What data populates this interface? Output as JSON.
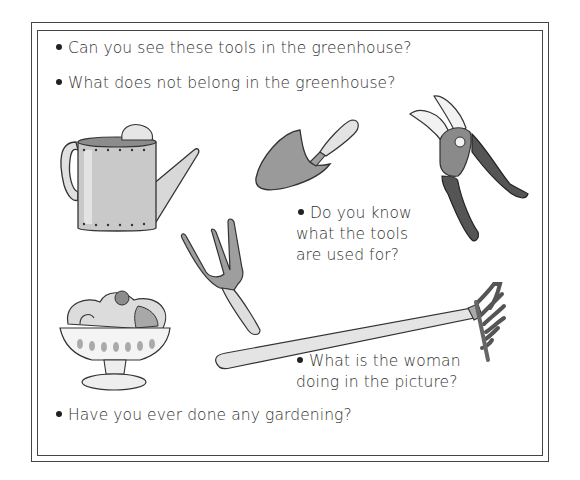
{
  "page": {
    "type": "worksheet",
    "frame": {
      "style": "double-line hand-drawn border",
      "color": "#444444"
    }
  },
  "questions": [
    {
      "text": "Can you see these tools in the greenhouse?"
    },
    {
      "text": "What does not belong in the greenhouse?"
    },
    {
      "line1": "Do you know",
      "line2": "what the tools",
      "line3": "are used for?"
    },
    {
      "line1": "What is the woman",
      "line2": "doing in the picture?"
    },
    {
      "text": "Have you ever done any gardening?"
    }
  ],
  "illustrations": [
    {
      "name": "watering-can",
      "label": "Watering can"
    },
    {
      "name": "trowel",
      "label": "Trowel"
    },
    {
      "name": "pruning-shears",
      "label": "Pruning shears"
    },
    {
      "name": "hand-fork",
      "label": "Hand fork"
    },
    {
      "name": "ice-cream-sundae",
      "label": "Ice cream sundae"
    },
    {
      "name": "rake",
      "label": "Rake"
    }
  ]
}
